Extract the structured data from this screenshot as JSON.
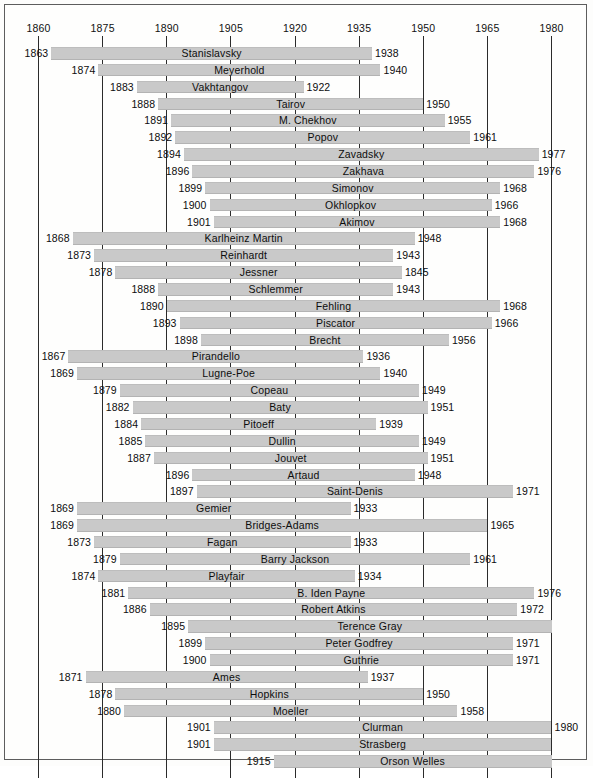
{
  "chart_data": {
    "type": "bar",
    "orientation": "horizontal",
    "subtype": "timeline-gantt",
    "title": "",
    "xlabel": "",
    "ylabel": "",
    "xlim": [
      1860,
      1980
    ],
    "xticks": [
      1860,
      1875,
      1890,
      1905,
      1920,
      1935,
      1950,
      1965,
      1980
    ],
    "xticklabels": [
      "1860",
      "1875",
      "1890",
      "1905",
      "1920",
      "1935",
      "1950",
      "1965",
      "1980"
    ],
    "grid": true,
    "legend": false,
    "bar_color": "#c9c9c9",
    "axis_color": "#2b2b2b",
    "text_color": "#0d0d0d",
    "note_truncated": "Bars reaching 1980 have no end-year label (life extends beyond chart range).",
    "categories": [
      "Stanislavsky",
      "Meyerhold",
      "Vakhtangov",
      "Tairov",
      "M. Chekhov",
      "Popov",
      "Zavadsky",
      "Zakhava",
      "Simonov",
      "Okhlopkov",
      "Akimov",
      "Karlheinz Martin",
      "Reinhardt",
      "Jessner",
      "Schlemmer",
      "Fehling",
      "Piscator",
      "Brecht",
      "Pirandello",
      "Lugne-Poe",
      "Copeau",
      "Baty",
      "Pitoeff",
      "Dullin",
      "Jouvet",
      "Artaud",
      "Saint-Denis",
      "Gemier",
      "Bridges-Adams",
      "Fagan",
      "Barry Jackson",
      "Playfair",
      "B. Iden Payne",
      "Robert Atkins",
      "Terence Gray",
      "Peter Godfrey",
      "Guthrie",
      "Ames",
      "Hopkins",
      "Moeller",
      "Clurman",
      "Strasberg",
      "Orson Welles"
    ],
    "bars": [
      {
        "name": "Stanislavsky",
        "start": 1863,
        "end": 1938,
        "start_label": "1863",
        "end_label": "1938"
      },
      {
        "name": "Meyerhold",
        "start": 1874,
        "end": 1940,
        "start_label": "1874",
        "end_label": "1940"
      },
      {
        "name": "Vakhtangov",
        "start": 1883,
        "end": 1922,
        "start_label": "1883",
        "end_label": "1922"
      },
      {
        "name": "Tairov",
        "start": 1888,
        "end": 1950,
        "start_label": "1888",
        "end_label": "1950"
      },
      {
        "name": "M. Chekhov",
        "start": 1891,
        "end": 1955,
        "start_label": "1891",
        "end_label": "1955"
      },
      {
        "name": "Popov",
        "start": 1892,
        "end": 1961,
        "start_label": "1892",
        "end_label": "1961"
      },
      {
        "name": "Zavadsky",
        "start": 1894,
        "end": 1977,
        "start_label": "1894",
        "end_label": "1977"
      },
      {
        "name": "Zakhava",
        "start": 1896,
        "end": 1976,
        "start_label": "1896",
        "end_label": "1976"
      },
      {
        "name": "Simonov",
        "start": 1899,
        "end": 1968,
        "start_label": "1899",
        "end_label": "1968"
      },
      {
        "name": "Okhlopkov",
        "start": 1900,
        "end": 1966,
        "start_label": "1900",
        "end_label": "1966"
      },
      {
        "name": "Akimov",
        "start": 1901,
        "end": 1968,
        "start_label": "1901",
        "end_label": "1968"
      },
      {
        "name": "Karlheinz Martin",
        "start": 1868,
        "end": 1948,
        "start_label": "1868",
        "end_label": "1948"
      },
      {
        "name": "Reinhardt",
        "start": 1873,
        "end": 1943,
        "start_label": "1873",
        "end_label": "1943"
      },
      {
        "name": "Jessner",
        "start": 1878,
        "end": 1945,
        "start_label": "1878",
        "end_label": "1845"
      },
      {
        "name": "Schlemmer",
        "start": 1888,
        "end": 1943,
        "start_label": "1888",
        "end_label": "1943"
      },
      {
        "name": "Fehling",
        "start": 1890,
        "end": 1968,
        "start_label": "1890",
        "end_label": "1968"
      },
      {
        "name": "Piscator",
        "start": 1893,
        "end": 1966,
        "start_label": "1893",
        "end_label": "1966"
      },
      {
        "name": "Brecht",
        "start": 1898,
        "end": 1956,
        "start_label": "1898",
        "end_label": "1956"
      },
      {
        "name": "Pirandello",
        "start": 1867,
        "end": 1936,
        "start_label": "1867",
        "end_label": "1936"
      },
      {
        "name": "Lugne-Poe",
        "start": 1869,
        "end": 1940,
        "start_label": "1869",
        "end_label": "1940"
      },
      {
        "name": "Copeau",
        "start": 1879,
        "end": 1949,
        "start_label": "1879",
        "end_label": "1949"
      },
      {
        "name": "Baty",
        "start": 1882,
        "end": 1951,
        "start_label": "1882",
        "end_label": "1951"
      },
      {
        "name": "Pitoeff",
        "start": 1884,
        "end": 1939,
        "start_label": "1884",
        "end_label": "1939"
      },
      {
        "name": "Dullin",
        "start": 1885,
        "end": 1949,
        "start_label": "1885",
        "end_label": "1949"
      },
      {
        "name": "Jouvet",
        "start": 1887,
        "end": 1951,
        "start_label": "1887",
        "end_label": "1951"
      },
      {
        "name": "Artaud",
        "start": 1896,
        "end": 1948,
        "start_label": "1896",
        "end_label": "1948"
      },
      {
        "name": "Saint-Denis",
        "start": 1897,
        "end": 1971,
        "start_label": "1897",
        "end_label": "1971"
      },
      {
        "name": "Gemier",
        "start": 1869,
        "end": 1933,
        "start_label": "1869",
        "end_label": "1933"
      },
      {
        "name": "Bridges-Adams",
        "start": 1869,
        "end": 1965,
        "start_label": "1869",
        "end_label": "1965"
      },
      {
        "name": "Fagan",
        "start": 1873,
        "end": 1933,
        "start_label": "1873",
        "end_label": "1933"
      },
      {
        "name": "Barry Jackson",
        "start": 1879,
        "end": 1961,
        "start_label": "1879",
        "end_label": "1961"
      },
      {
        "name": "Playfair",
        "start": 1874,
        "end": 1934,
        "start_label": "1874",
        "end_label": "1934"
      },
      {
        "name": "B. Iden Payne",
        "start": 1881,
        "end": 1976,
        "start_label": "1881",
        "end_label": "1976"
      },
      {
        "name": "Robert Atkins",
        "start": 1886,
        "end": 1972,
        "start_label": "1886",
        "end_label": "1972"
      },
      {
        "name": "Terence Gray",
        "start": 1895,
        "end": 1980,
        "start_label": "1895",
        "end_label": ""
      },
      {
        "name": "Peter Godfrey",
        "start": 1899,
        "end": 1971,
        "start_label": "1899",
        "end_label": "1971"
      },
      {
        "name": "Guthrie",
        "start": 1900,
        "end": 1971,
        "start_label": "1900",
        "end_label": "1971"
      },
      {
        "name": "Ames",
        "start": 1871,
        "end": 1937,
        "start_label": "1871",
        "end_label": "1937"
      },
      {
        "name": "Hopkins",
        "start": 1878,
        "end": 1950,
        "start_label": "1878",
        "end_label": "1950"
      },
      {
        "name": "Moeller",
        "start": 1880,
        "end": 1958,
        "start_label": "1880",
        "end_label": "1958"
      },
      {
        "name": "Clurman",
        "start": 1901,
        "end": 1980,
        "start_label": "1901",
        "end_label": "1980"
      },
      {
        "name": "Strasberg",
        "start": 1901,
        "end": 1980,
        "start_label": "1901",
        "end_label": ""
      },
      {
        "name": "Orson Welles",
        "start": 1915,
        "end": 1980,
        "start_label": "1915",
        "end_label": ""
      }
    ]
  }
}
